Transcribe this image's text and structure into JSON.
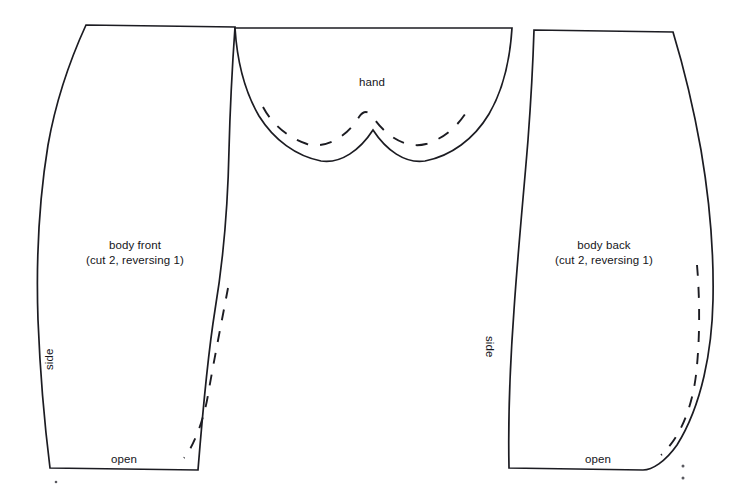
{
  "sheet": {
    "title": "Sewing pattern layout sheet",
    "background_color": "#ffffff",
    "ink_color": "#1c1c22",
    "width": 741,
    "height": 486
  },
  "pieces": [
    {
      "id": "body-front",
      "name": "body front",
      "label": "body front",
      "cut_note": "(cut 2, reversing 1)",
      "side_label": "side",
      "open_label": "open",
      "has_dashed_stitch_line": true
    },
    {
      "id": "hand",
      "name": "hand",
      "label": "hand",
      "has_dashed_stitch_line": true
    },
    {
      "id": "body-back",
      "name": "body back",
      "label": "body back",
      "cut_note": "(cut 2, reversing 1)",
      "side_label": "side",
      "open_label": "open",
      "has_dashed_stitch_line": true
    }
  ],
  "labels": {
    "body_front_name": "body front",
    "body_front_cut": "(cut 2, reversing 1)",
    "body_back_name": "body back",
    "body_back_cut": "(cut 2, reversing 1)",
    "hand_name": "hand",
    "side_left": "side",
    "side_right": "side",
    "open_left": "open",
    "open_right": "open"
  }
}
